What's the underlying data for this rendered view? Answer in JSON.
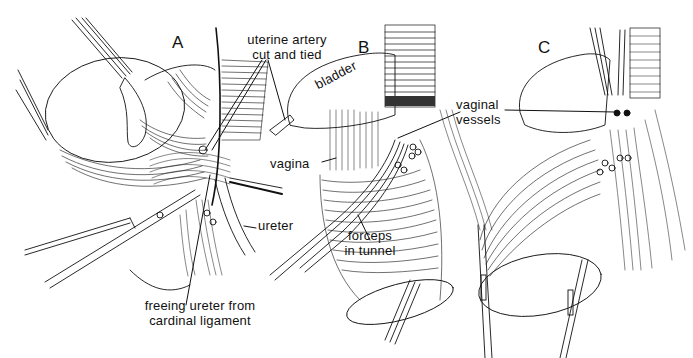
{
  "figure": {
    "ink_color": "#111111",
    "background_color": "#ffffff",
    "panels": [
      {
        "id": "A",
        "letter": "A",
        "labels": {
          "uterine_artery": [
            "uterine artery",
            "cut and tied"
          ],
          "ureter": "ureter",
          "freeing": [
            "freeing ureter from",
            "cardinal ligament"
          ]
        }
      },
      {
        "id": "B",
        "letter": "B",
        "labels": {
          "bladder": "bladder",
          "vaginal_vessels": [
            "vaginal",
            "vessels"
          ],
          "vagina": "vagina",
          "forceps": [
            "forceps",
            "in tunnel"
          ]
        }
      },
      {
        "id": "C",
        "letter": "C",
        "labels": {}
      }
    ],
    "caption": {
      "visible": "cut off at bottom edge; text not legible"
    }
  }
}
